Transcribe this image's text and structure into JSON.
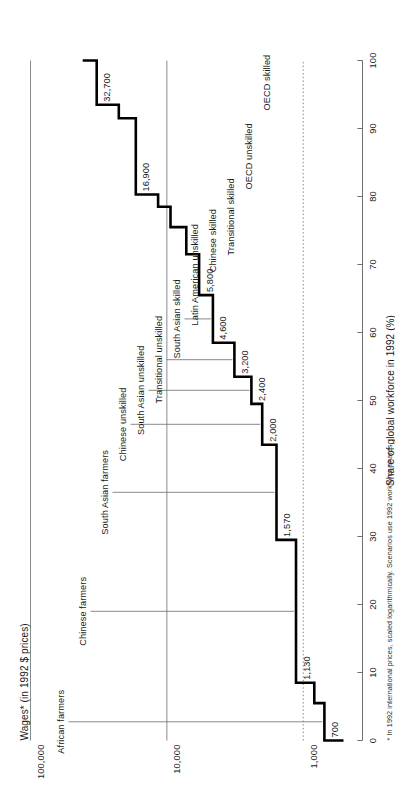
{
  "axes": {
    "y_title": "Wages* (in 1992 $ prices)",
    "x_title": "Share of global workforce in 1992 (%)",
    "y_ticks": [
      "100,000",
      "10,000",
      "1,000"
    ],
    "x_ticks": [
      "0",
      "10",
      "20",
      "30",
      "40",
      "50",
      "60",
      "70",
      "80",
      "90",
      "100"
    ]
  },
  "footnote": "* In 1992 international prices, scaled logarithmically. Scenarios use 1992 workforce shares",
  "colors": {
    "line": "#000000",
    "grid": "#8a8a8a",
    "axis": "#6f6f6f",
    "text": "#1a1a1a"
  },
  "chart_data": {
    "type": "line",
    "subtype": "step",
    "title": "",
    "xlabel": "Share of global workforce in 1992 (%)",
    "ylabel": "Wages* (in 1992 $ prices)",
    "xlim": [
      0,
      100
    ],
    "ylim": [
      600,
      100000
    ],
    "yscale": "log",
    "grid": true,
    "gridlines": [
      {
        "value": 100000,
        "label": "100,000",
        "style": "solid"
      },
      {
        "value": 10000,
        "label": "10,000",
        "style": "solid"
      },
      {
        "value": 1000,
        "label": "1,000",
        "style": "dotted"
      }
    ],
    "x_ticks": [
      0,
      10,
      20,
      30,
      40,
      50,
      60,
      70,
      80,
      90,
      100
    ],
    "note": "Cumulative step profile: each segment spans a workforce share band at a constant wage.",
    "steps": [
      {
        "label": "African farmers",
        "wage": 700,
        "x_start": 0,
        "x_end": 5.5,
        "value_label": "700",
        "labelled": true
      },
      {
        "label": "",
        "wage": 830,
        "x_start": 5.5,
        "x_end": 8.5,
        "value_label": "",
        "labelled": false
      },
      {
        "label": "Chinese farmers",
        "wage": 1130,
        "x_start": 8.5,
        "x_end": 29.5,
        "value_label": "1,130",
        "labelled": true
      },
      {
        "label": "South Asian farmers",
        "wage": 1570,
        "x_start": 29.5,
        "x_end": 43.5,
        "value_label": "1,570",
        "labelled": true
      },
      {
        "label": "Chinese unskilled",
        "wage": 2000,
        "x_start": 43.5,
        "x_end": 49.5,
        "value_label": "2,000",
        "labelled": true
      },
      {
        "label": "South Asian unskilled",
        "wage": 2400,
        "x_start": 49.5,
        "x_end": 53.5,
        "value_label": "2,400",
        "labelled": true
      },
      {
        "label": "Transitional unskilled",
        "wage": 3200,
        "x_start": 53.5,
        "x_end": 58.5,
        "value_label": "3,200",
        "labelled": true
      },
      {
        "label": "South Asian skilled",
        "wage": 4600,
        "x_start": 58.5,
        "x_end": 65.5,
        "value_label": "4,600",
        "labelled": true
      },
      {
        "label": "Latin American unskilled",
        "wage": 5800,
        "x_start": 65.5,
        "x_end": 71.5,
        "value_label": "5,800",
        "labelled": true
      },
      {
        "label": "Chinese skilled",
        "wage": 7200,
        "x_start": 71.5,
        "x_end": 75.5,
        "value_label": "",
        "labelled": false
      },
      {
        "label": "Transitional skilled",
        "wage": 9400,
        "x_start": 75.5,
        "x_end": 78.5,
        "value_label": "",
        "labelled": false
      },
      {
        "label": "",
        "wage": 11600,
        "x_start": 78.5,
        "x_end": 80.3,
        "value_label": "",
        "labelled": false
      },
      {
        "label": "OECD unskilled",
        "wage": 16900,
        "x_start": 80.3,
        "x_end": 91.5,
        "value_label": "16,900",
        "labelled": true
      },
      {
        "label": "",
        "wage": 22500,
        "x_start": 91.5,
        "x_end": 93.5,
        "value_label": "",
        "labelled": false
      },
      {
        "label": "OECD skilled",
        "wage": 32700,
        "x_start": 93.5,
        "x_end": 100,
        "value_label": "32,700",
        "labelled": true
      }
    ],
    "callouts": [
      {
        "label": "OECD skilled",
        "value_label": "32,700"
      },
      {
        "label": "OECD unskilled",
        "value_label": "16,900"
      },
      {
        "label": "Transitional skilled",
        "value_label": ""
      },
      {
        "label": "Chinese skilled",
        "value_label": ""
      },
      {
        "label": "Latin American unskilled",
        "value_label": "5,800"
      },
      {
        "label": "South Asian skilled",
        "value_label": "4,600"
      },
      {
        "label": "Transitional unskilled",
        "value_label": "3,200"
      },
      {
        "label": "South Asian unskilled",
        "value_label": "2,400"
      },
      {
        "label": "Chinese unskilled",
        "value_label": "2,000"
      },
      {
        "label": "South Asian farmers",
        "value_label": "1,570"
      },
      {
        "label": "Chinese farmers",
        "value_label": "1,130"
      },
      {
        "label": "African farmers",
        "value_label": "700"
      }
    ]
  }
}
